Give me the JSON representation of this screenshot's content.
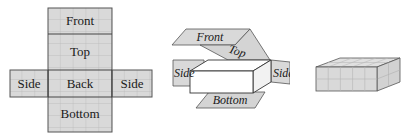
{
  "figure": {
    "panels": [
      {
        "id": "net",
        "description": "Flat net of a rectangular box",
        "labels": {
          "front": "Front",
          "top": "Top",
          "back": "Back",
          "bottom": "Bottom",
          "side_left": "Side",
          "side_right": "Side"
        }
      },
      {
        "id": "folding",
        "description": "Net folding around box",
        "labels": {
          "front": "Front",
          "top": "Top",
          "side_left": "Side",
          "side_right": "Side",
          "bottom": "Bottom"
        }
      },
      {
        "id": "closed-box",
        "description": "Closed box with grid",
        "labels": {}
      }
    ],
    "colors": {
      "face_fill": "#d9d9d9",
      "grid_line": "#b5b5b5",
      "edge": "#4a4a4a",
      "box_white": "#ffffff"
    }
  }
}
